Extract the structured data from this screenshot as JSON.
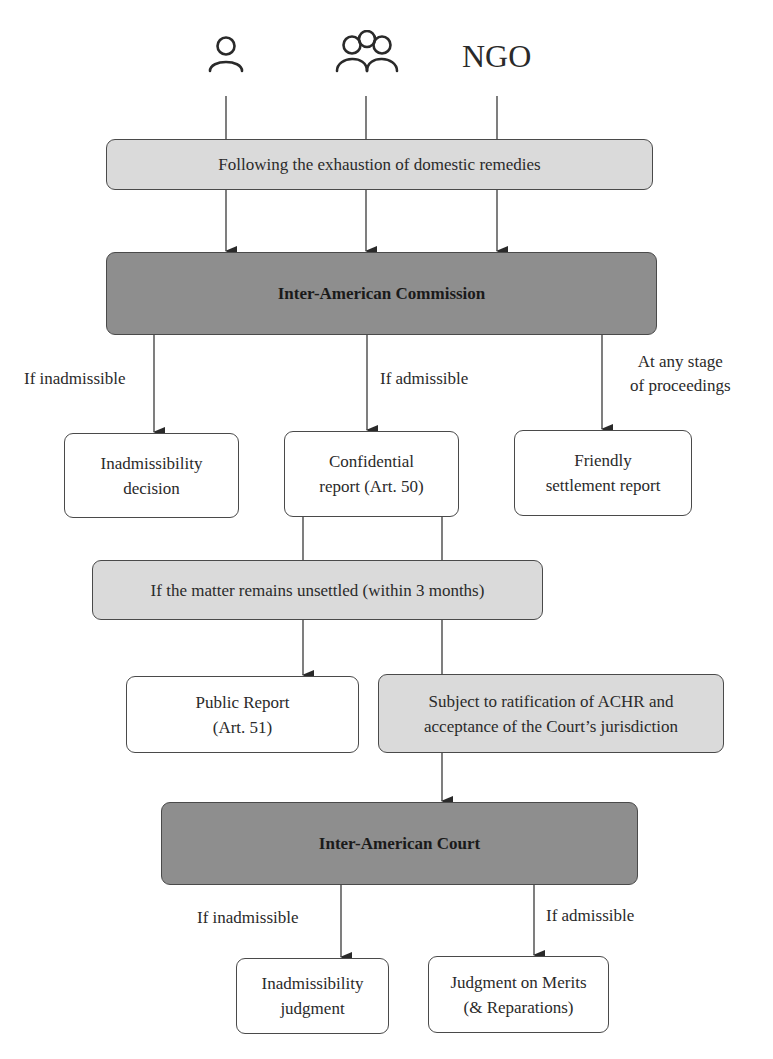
{
  "diagram": {
    "title": "",
    "actors": [
      {
        "id": "individual",
        "icon": "person-icon",
        "label": ""
      },
      {
        "id": "group",
        "icon": "group-icon",
        "label": ""
      },
      {
        "id": "ngo",
        "icon": "",
        "label": "NGO"
      }
    ],
    "nodes": {
      "exhaustion": "Following the exhaustion of domestic remedies",
      "commission": "Inter-American Commission",
      "inadmissibility_decision": "Inadmissibility\ndecision",
      "confidential_report": "Confidential\nreport (Art. 50)",
      "friendly_settlement": "Friendly\nsettlement report",
      "unsettled": "If the matter remains unsettled (within 3 months)",
      "public_report": "Public Report\n(Art. 51)",
      "ratification": "Subject to ratification of ACHR and\nacceptance of the Court’s jurisdiction",
      "court": "Inter-American Court",
      "inadmissibility_judgment": "Inadmissibility\njudgment",
      "merits_judgment": "Judgment on Merits\n(& Reparations)"
    },
    "edge_labels": {
      "commission_inadmissible": "If inadmissible",
      "commission_admissible": "If admissible",
      "any_stage": "At any stage\nof proceedings",
      "court_inadmissible": "If inadmissible",
      "court_admissible": "If admissible"
    },
    "edges": [
      {
        "from": "individual",
        "to": "exhaustion",
        "arrow": false
      },
      {
        "from": "group",
        "to": "exhaustion",
        "arrow": false
      },
      {
        "from": "ngo",
        "to": "exhaustion",
        "arrow": false
      },
      {
        "from": "exhaustion",
        "to": "commission",
        "arrow": true,
        "count": 3
      },
      {
        "from": "commission",
        "to": "inadmissibility_decision",
        "label": "If inadmissible",
        "arrow": true
      },
      {
        "from": "commission",
        "to": "confidential_report",
        "label": "If admissible",
        "arrow": true
      },
      {
        "from": "commission",
        "to": "friendly_settlement",
        "label": "At any stage of proceedings",
        "arrow": true
      },
      {
        "from": "confidential_report",
        "to": "unsettled",
        "arrow": false,
        "count": 2
      },
      {
        "from": "unsettled",
        "to": "public_report",
        "arrow": true
      },
      {
        "from": "unsettled",
        "to": "ratification",
        "arrow": false
      },
      {
        "from": "ratification",
        "to": "court",
        "arrow": true
      },
      {
        "from": "court",
        "to": "inadmissibility_judgment",
        "label": "If inadmissible",
        "arrow": true
      },
      {
        "from": "court",
        "to": "merits_judgment",
        "label": "If admissible",
        "arrow": true
      }
    ],
    "colors": {
      "dark_fill": "#8e8e8e",
      "light_fill": "#dadada",
      "white_fill": "#ffffff",
      "stroke": "#4a4a4a"
    }
  }
}
